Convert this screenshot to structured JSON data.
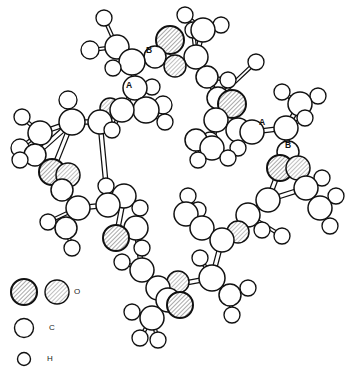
{
  "figure": {
    "type": "molecular-structure-diagram",
    "title": "",
    "background_color": "#ffffff",
    "line_color": "#111111",
    "atom_fill_color": "#ffffff",
    "oxygen_hatch_color": "#8c8c8c",
    "width": 349,
    "height": 379
  },
  "legend": {
    "items": [
      {
        "symbol": "O",
        "label": "O",
        "style": "hatched",
        "count_swatches": 2,
        "radii": [
          13,
          12
        ]
      },
      {
        "symbol": "C",
        "label": "C",
        "style": "open",
        "count_swatches": 1,
        "radii": [
          9
        ]
      },
      {
        "symbol": "H",
        "label": "H",
        "style": "open",
        "count_swatches": 1,
        "radii": [
          6
        ]
      }
    ]
  },
  "bond_labels": [
    {
      "text": "B",
      "x": 146,
      "y": 50
    },
    {
      "text": "A",
      "x": 126,
      "y": 85
    },
    {
      "text": "A",
      "x": 259,
      "y": 122
    },
    {
      "text": "B",
      "x": 285,
      "y": 145
    }
  ],
  "chart_data": {
    "type": "scatter",
    "xlabel": "",
    "ylabel": "",
    "legend_position": "bottom-left",
    "atoms": [
      {
        "id": "H1",
        "el": "H",
        "x": 104,
        "y": 18,
        "r": 8
      },
      {
        "id": "H2",
        "el": "H",
        "x": 90,
        "y": 50,
        "r": 9
      },
      {
        "id": "C1",
        "el": "C",
        "x": 117,
        "y": 47,
        "r": 12
      },
      {
        "id": "H3",
        "el": "H",
        "x": 113,
        "y": 68,
        "r": 8
      },
      {
        "id": "C2",
        "el": "C",
        "x": 132,
        "y": 62,
        "r": 13
      },
      {
        "id": "O1",
        "el": "O",
        "x": 170,
        "y": 40,
        "r": 14
      },
      {
        "id": "O2",
        "el": "O",
        "x": 175,
        "y": 66,
        "r": 11
      },
      {
        "id": "C3",
        "el": "C",
        "x": 155,
        "y": 57,
        "r": 11
      },
      {
        "id": "C4",
        "el": "C",
        "x": 196,
        "y": 57,
        "r": 12
      },
      {
        "id": "H4",
        "el": "H",
        "x": 193,
        "y": 30,
        "r": 8
      },
      {
        "id": "C5",
        "el": "C",
        "x": 203,
        "y": 30,
        "r": 12
      },
      {
        "id": "H5",
        "el": "H",
        "x": 221,
        "y": 25,
        "r": 8
      },
      {
        "id": "H6",
        "el": "H",
        "x": 185,
        "y": 15,
        "r": 8
      },
      {
        "id": "C6",
        "el": "C",
        "x": 207,
        "y": 77,
        "r": 11
      },
      {
        "id": "H7",
        "el": "H",
        "x": 228,
        "y": 80,
        "r": 8
      },
      {
        "id": "C7",
        "el": "C",
        "x": 218,
        "y": 98,
        "r": 11
      },
      {
        "id": "C8",
        "el": "C",
        "x": 135,
        "y": 88,
        "r": 12
      },
      {
        "id": "H8",
        "el": "H",
        "x": 152,
        "y": 87,
        "r": 8
      },
      {
        "id": "C9",
        "el": "C",
        "x": 146,
        "y": 110,
        "r": 13
      },
      {
        "id": "H9",
        "el": "H",
        "x": 163,
        "y": 105,
        "r": 9
      },
      {
        "id": "H10",
        "el": "H",
        "x": 165,
        "y": 122,
        "r": 8
      },
      {
        "id": "C10",
        "el": "C",
        "x": 122,
        "y": 110,
        "r": 12
      },
      {
        "id": "O3",
        "el": "O",
        "x": 110,
        "y": 108,
        "r": 10
      },
      {
        "id": "H11",
        "el": "H",
        "x": 112,
        "y": 130,
        "r": 8
      },
      {
        "id": "C11",
        "el": "C",
        "x": 100,
        "y": 122,
        "r": 12
      },
      {
        "id": "C12",
        "el": "C",
        "x": 72,
        "y": 122,
        "r": 13
      },
      {
        "id": "H12",
        "el": "H",
        "x": 68,
        "y": 100,
        "r": 9
      },
      {
        "id": "C13",
        "el": "C",
        "x": 40,
        "y": 133,
        "r": 12
      },
      {
        "id": "H13",
        "el": "H",
        "x": 22,
        "y": 117,
        "r": 8
      },
      {
        "id": "H14",
        "el": "H",
        "x": 20,
        "y": 148,
        "r": 9
      },
      {
        "id": "O4",
        "el": "O",
        "x": 52,
        "y": 172,
        "r": 13
      },
      {
        "id": "O5",
        "el": "O",
        "x": 68,
        "y": 175,
        "r": 12
      },
      {
        "id": "C14",
        "el": "C",
        "x": 62,
        "y": 190,
        "r": 11
      },
      {
        "id": "C15",
        "el": "C",
        "x": 78,
        "y": 208,
        "r": 12
      },
      {
        "id": "H15",
        "el": "H",
        "x": 48,
        "y": 222,
        "r": 8
      },
      {
        "id": "C16",
        "el": "C",
        "x": 66,
        "y": 228,
        "r": 11
      },
      {
        "id": "H16",
        "el": "H",
        "x": 72,
        "y": 248,
        "r": 8
      },
      {
        "id": "C17",
        "el": "C",
        "x": 108,
        "y": 205,
        "r": 12
      },
      {
        "id": "H17",
        "el": "H",
        "x": 106,
        "y": 186,
        "r": 8
      },
      {
        "id": "C18",
        "el": "C",
        "x": 124,
        "y": 196,
        "r": 12
      },
      {
        "id": "H18",
        "el": "H",
        "x": 140,
        "y": 208,
        "r": 8
      },
      {
        "id": "O6",
        "el": "O",
        "x": 116,
        "y": 238,
        "r": 13
      },
      {
        "id": "C19",
        "el": "C",
        "x": 136,
        "y": 228,
        "r": 12
      },
      {
        "id": "H19",
        "el": "H",
        "x": 142,
        "y": 248,
        "r": 8
      },
      {
        "id": "C20",
        "el": "C",
        "x": 142,
        "y": 270,
        "r": 12
      },
      {
        "id": "H20",
        "el": "H",
        "x": 122,
        "y": 262,
        "r": 8
      },
      {
        "id": "C21",
        "el": "C",
        "x": 158,
        "y": 288,
        "r": 12
      },
      {
        "id": "O7",
        "el": "O",
        "x": 178,
        "y": 282,
        "r": 11
      },
      {
        "id": "O8",
        "el": "O",
        "x": 180,
        "y": 305,
        "r": 13
      },
      {
        "id": "C22",
        "el": "C",
        "x": 168,
        "y": 300,
        "r": 12
      },
      {
        "id": "C23",
        "el": "C",
        "x": 152,
        "y": 318,
        "r": 12
      },
      {
        "id": "H21",
        "el": "H",
        "x": 132,
        "y": 312,
        "r": 8
      },
      {
        "id": "H22",
        "el": "H",
        "x": 140,
        "y": 338,
        "r": 8
      },
      {
        "id": "H23",
        "el": "H",
        "x": 158,
        "y": 340,
        "r": 8
      },
      {
        "id": "C24",
        "el": "C",
        "x": 212,
        "y": 278,
        "r": 13
      },
      {
        "id": "H24",
        "el": "H",
        "x": 200,
        "y": 258,
        "r": 8
      },
      {
        "id": "C25",
        "el": "C",
        "x": 230,
        "y": 295,
        "r": 11
      },
      {
        "id": "H25",
        "el": "H",
        "x": 248,
        "y": 288,
        "r": 8
      },
      {
        "id": "H26",
        "el": "H",
        "x": 232,
        "y": 315,
        "r": 8
      },
      {
        "id": "C26",
        "el": "C",
        "x": 222,
        "y": 240,
        "r": 12
      },
      {
        "id": "O9",
        "el": "O",
        "x": 238,
        "y": 232,
        "r": 11
      },
      {
        "id": "C27",
        "el": "C",
        "x": 202,
        "y": 228,
        "r": 12
      },
      {
        "id": "H27",
        "el": "H",
        "x": 198,
        "y": 210,
        "r": 8
      },
      {
        "id": "C28",
        "el": "C",
        "x": 186,
        "y": 214,
        "r": 12
      },
      {
        "id": "H28",
        "el": "H",
        "x": 188,
        "y": 196,
        "r": 8
      },
      {
        "id": "C29",
        "el": "C",
        "x": 248,
        "y": 215,
        "r": 12
      },
      {
        "id": "H29",
        "el": "H",
        "x": 262,
        "y": 230,
        "r": 8
      },
      {
        "id": "C30",
        "el": "C",
        "x": 268,
        "y": 200,
        "r": 12
      },
      {
        "id": "O10",
        "el": "O",
        "x": 280,
        "y": 168,
        "r": 13
      },
      {
        "id": "O11",
        "el": "O",
        "x": 298,
        "y": 168,
        "r": 12
      },
      {
        "id": "C31",
        "el": "C",
        "x": 288,
        "y": 152,
        "r": 11
      },
      {
        "id": "C32",
        "el": "C",
        "x": 286,
        "y": 128,
        "r": 12
      },
      {
        "id": "H30",
        "el": "H",
        "x": 305,
        "y": 118,
        "r": 8
      },
      {
        "id": "C33",
        "el": "C",
        "x": 300,
        "y": 104,
        "r": 12
      },
      {
        "id": "H31",
        "el": "H",
        "x": 318,
        "y": 96,
        "r": 8
      },
      {
        "id": "H32",
        "el": "H",
        "x": 282,
        "y": 92,
        "r": 8
      },
      {
        "id": "C34",
        "el": "C",
        "x": 252,
        "y": 132,
        "r": 12
      },
      {
        "id": "H33",
        "el": "H",
        "x": 238,
        "y": 148,
        "r": 8
      },
      {
        "id": "C35",
        "el": "C",
        "x": 238,
        "y": 130,
        "r": 12
      },
      {
        "id": "O12",
        "el": "O",
        "x": 232,
        "y": 104,
        "r": 14
      },
      {
        "id": "C36",
        "el": "C",
        "x": 216,
        "y": 120,
        "r": 12
      },
      {
        "id": "H34",
        "el": "H",
        "x": 210,
        "y": 140,
        "r": 8
      },
      {
        "id": "C37",
        "el": "C",
        "x": 212,
        "y": 148,
        "r": 12
      },
      {
        "id": "H35",
        "el": "H",
        "x": 228,
        "y": 158,
        "r": 8
      },
      {
        "id": "C38",
        "el": "C",
        "x": 196,
        "y": 140,
        "r": 11
      },
      {
        "id": "H36",
        "el": "H",
        "x": 198,
        "y": 160,
        "r": 8
      },
      {
        "id": "C39",
        "el": "C",
        "x": 306,
        "y": 188,
        "r": 12
      },
      {
        "id": "H37",
        "el": "H",
        "x": 322,
        "y": 178,
        "r": 8
      },
      {
        "id": "C40",
        "el": "C",
        "x": 320,
        "y": 208,
        "r": 12
      },
      {
        "id": "H38",
        "el": "H",
        "x": 336,
        "y": 196,
        "r": 8
      },
      {
        "id": "H39",
        "el": "H",
        "x": 330,
        "y": 226,
        "r": 8
      },
      {
        "id": "H40",
        "el": "H",
        "x": 282,
        "y": 236,
        "r": 8
      },
      {
        "id": "H41",
        "el": "H",
        "x": 256,
        "y": 62,
        "r": 8
      },
      {
        "id": "C41",
        "el": "C",
        "x": 35,
        "y": 155,
        "r": 11
      },
      {
        "id": "H42",
        "el": "H",
        "x": 20,
        "y": 160,
        "r": 8
      }
    ],
    "bonds": [
      [
        "C1",
        "H1"
      ],
      [
        "C1",
        "H2"
      ],
      [
        "C1",
        "C2"
      ],
      [
        "C2",
        "H3"
      ],
      [
        "C2",
        "C3"
      ],
      [
        "C3",
        "O1"
      ],
      [
        "C3",
        "O2"
      ],
      [
        "O2",
        "C4"
      ],
      [
        "C4",
        "C5"
      ],
      [
        "C4",
        "H4"
      ],
      [
        "C5",
        "H5"
      ],
      [
        "C5",
        "H6"
      ],
      [
        "C4",
        "C6"
      ],
      [
        "C6",
        "H7"
      ],
      [
        "C6",
        "C7"
      ],
      [
        "C2",
        "C8"
      ],
      [
        "C8",
        "H8"
      ],
      [
        "C8",
        "C9"
      ],
      [
        "C9",
        "H9"
      ],
      [
        "C9",
        "H10"
      ],
      [
        "C8",
        "C10"
      ],
      [
        "C10",
        "O3"
      ],
      [
        "C10",
        "H11"
      ],
      [
        "C10",
        "C11"
      ],
      [
        "C11",
        "C12"
      ],
      [
        "C12",
        "H12"
      ],
      [
        "C12",
        "C13"
      ],
      [
        "C13",
        "H13"
      ],
      [
        "C13",
        "H14"
      ],
      [
        "C12",
        "C41"
      ],
      [
        "C41",
        "H42"
      ],
      [
        "C12",
        "O4"
      ],
      [
        "O4",
        "O5"
      ],
      [
        "O5",
        "C14"
      ],
      [
        "C14",
        "C15"
      ],
      [
        "C15",
        "H15"
      ],
      [
        "C15",
        "C16"
      ],
      [
        "C16",
        "H16"
      ],
      [
        "C15",
        "C17"
      ],
      [
        "C17",
        "H17"
      ],
      [
        "C17",
        "C18"
      ],
      [
        "C18",
        "H18"
      ],
      [
        "C18",
        "O6"
      ],
      [
        "O6",
        "C19"
      ],
      [
        "C19",
        "H19"
      ],
      [
        "C19",
        "C20"
      ],
      [
        "C20",
        "H20"
      ],
      [
        "C20",
        "C21"
      ],
      [
        "C21",
        "O7"
      ],
      [
        "C21",
        "O8"
      ],
      [
        "O8",
        "C22"
      ],
      [
        "C22",
        "C23"
      ],
      [
        "C23",
        "H21"
      ],
      [
        "C23",
        "H22"
      ],
      [
        "C23",
        "H23"
      ],
      [
        "C21",
        "C24"
      ],
      [
        "C24",
        "H24"
      ],
      [
        "C24",
        "C25"
      ],
      [
        "C25",
        "H25"
      ],
      [
        "C25",
        "H26"
      ],
      [
        "C24",
        "C26"
      ],
      [
        "C26",
        "O9"
      ],
      [
        "C26",
        "C27"
      ],
      [
        "C27",
        "H27"
      ],
      [
        "C27",
        "C28"
      ],
      [
        "C28",
        "H28"
      ],
      [
        "C26",
        "C29"
      ],
      [
        "C29",
        "H29"
      ],
      [
        "C29",
        "C30"
      ],
      [
        "C30",
        "O10"
      ],
      [
        "O10",
        "O11"
      ],
      [
        "O11",
        "C31"
      ],
      [
        "C31",
        "C32"
      ],
      [
        "C32",
        "H30"
      ],
      [
        "C32",
        "C33"
      ],
      [
        "C33",
        "H31"
      ],
      [
        "C33",
        "H32"
      ],
      [
        "C32",
        "C34"
      ],
      [
        "C34",
        "H33"
      ],
      [
        "C34",
        "C35"
      ],
      [
        "C35",
        "O12"
      ],
      [
        "C35",
        "C36"
      ],
      [
        "C36",
        "H34"
      ],
      [
        "C36",
        "C37"
      ],
      [
        "C37",
        "H35"
      ],
      [
        "C37",
        "C38"
      ],
      [
        "C38",
        "H36"
      ],
      [
        "C30",
        "C39"
      ],
      [
        "C39",
        "H37"
      ],
      [
        "C39",
        "C40"
      ],
      [
        "C40",
        "H38"
      ],
      [
        "C40",
        "H39"
      ],
      [
        "C29",
        "H40"
      ],
      [
        "C7",
        "H41"
      ],
      [
        "C7",
        "C36"
      ],
      [
        "C11",
        "C17"
      ]
    ]
  }
}
